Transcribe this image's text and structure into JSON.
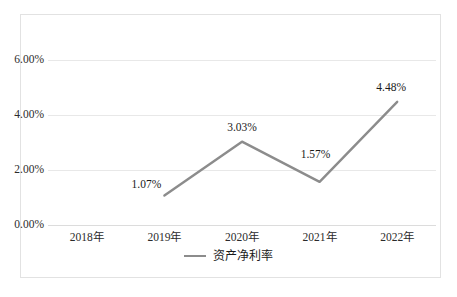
{
  "chart_data": {
    "type": "line",
    "title": "",
    "subtitle": "",
    "xlabel": "",
    "ylabel": "",
    "categories": [
      "2018年",
      "2019年",
      "2020年",
      "2021年",
      "2022年"
    ],
    "series": [
      {
        "name": "资产净利率",
        "values": [
          null,
          1.07,
          3.03,
          1.57,
          4.48
        ],
        "value_labels": [
          "",
          "1.07%",
          "3.03%",
          "1.57%",
          "4.48%"
        ],
        "color": "#8c8c8c"
      }
    ],
    "ylim": [
      0,
      6
    ],
    "ytick_values": [
      0,
      2,
      4,
      6
    ],
    "ytick_labels": [
      "0.00%",
      "2.00%",
      "4.00%",
      "6.00%"
    ],
    "grid": true,
    "grid_axis": "y",
    "legend_position": "bottom-center",
    "data_labels_shown": true
  },
  "axes": {
    "y": {
      "ticks": [
        {
          "value": 6,
          "label": "6.00%"
        },
        {
          "value": 4,
          "label": "4.00%"
        },
        {
          "value": 2,
          "label": "2.00%"
        },
        {
          "value": 0,
          "label": "0.00%"
        }
      ]
    },
    "x": {
      "ticks": [
        {
          "label": "2018年"
        },
        {
          "label": "2019年"
        },
        {
          "label": "2020年"
        },
        {
          "label": "2021年"
        },
        {
          "label": "2022年"
        }
      ]
    }
  },
  "points": [
    {
      "category": "2019年",
      "label": "1.07%",
      "value": 1.07
    },
    {
      "category": "2020年",
      "label": "3.03%",
      "value": 3.03
    },
    {
      "category": "2021年",
      "label": "1.57%",
      "value": 1.57
    },
    {
      "category": "2022年",
      "label": "4.48%",
      "value": 4.48
    }
  ],
  "legend": {
    "items": [
      {
        "label": "资产净利率",
        "color": "#8c8c8c",
        "marker": "line-swatch"
      }
    ]
  },
  "caption": {
    "text": ""
  },
  "colors": {
    "series_line": "#8c8c8c",
    "gridline": "#e8e8e8",
    "frame_border": "#e2e2e2",
    "text": "#1a1a1a",
    "background": "#ffffff"
  }
}
